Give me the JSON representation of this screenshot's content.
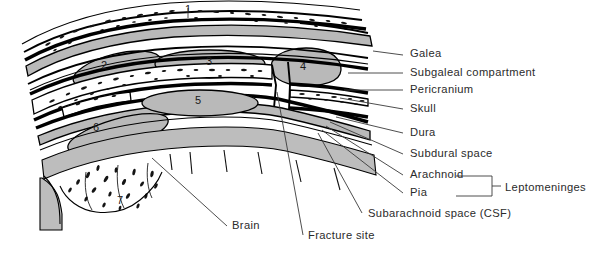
{
  "figure": {
    "region_numbers": [
      {
        "id": "1",
        "label": "1",
        "x": 188,
        "y": 13
      },
      {
        "id": "2",
        "label": "2",
        "x": 104,
        "y": 69
      },
      {
        "id": "3",
        "label": "3",
        "x": 209,
        "y": 65
      },
      {
        "id": "4",
        "label": "4",
        "x": 303,
        "y": 70
      },
      {
        "id": "5",
        "label": "5",
        "x": 198,
        "y": 104
      },
      {
        "id": "6",
        "label": "6",
        "x": 96,
        "y": 131
      },
      {
        "id": "7",
        "label": "7",
        "x": 120,
        "y": 204
      }
    ],
    "callouts": [
      {
        "id": "galea",
        "label": "Galea",
        "text_x": 410,
        "text_y": 57,
        "line": [
          [
            373,
            51
          ],
          [
            403,
            55
          ]
        ]
      },
      {
        "id": "subgaleal-compartment",
        "label": "Subgaleal compartment",
        "text_x": 410,
        "text_y": 76,
        "line": [
          [
            348,
            73
          ],
          [
            403,
            73
          ]
        ]
      },
      {
        "id": "pericranium",
        "label": "Pericranium",
        "text_x": 410,
        "text_y": 93,
        "line": [
          [
            344,
            90
          ],
          [
            403,
            90
          ]
        ]
      },
      {
        "id": "skull",
        "label": "Skull",
        "text_x": 410,
        "text_y": 112,
        "line": [
          [
            340,
            98
          ],
          [
            403,
            109
          ]
        ]
      },
      {
        "id": "dura",
        "label": "Dura",
        "text_x": 410,
        "text_y": 136,
        "line": [
          [
            336,
            117
          ],
          [
            403,
            133
          ]
        ]
      },
      {
        "id": "subdural-space",
        "label": "Subdural space",
        "text_x": 410,
        "text_y": 157,
        "line": [
          [
            330,
            122
          ],
          [
            403,
            154
          ]
        ]
      },
      {
        "id": "arachnoid",
        "label": "Arachnoid",
        "text_x": 410,
        "text_y": 178,
        "line": [
          [
            326,
            126
          ],
          [
            403,
            175
          ]
        ]
      },
      {
        "id": "pia",
        "label": "Pia",
        "text_x": 410,
        "text_y": 196,
        "line": [
          [
            322,
            130
          ],
          [
            403,
            193
          ]
        ]
      },
      {
        "id": "subarachnoid-space",
        "label": "Subarachnoid space (CSF)",
        "text_x": 368,
        "text_y": 217,
        "line": [
          [
            318,
            133
          ],
          [
            362,
            213
          ]
        ]
      },
      {
        "id": "brain",
        "label": "Brain",
        "text_x": 232,
        "text_y": 229,
        "line": [
          [
            152,
            158
          ],
          [
            227,
            226
          ]
        ]
      },
      {
        "id": "fracture-site",
        "label": "Fracture site",
        "text_x": 308,
        "text_y": 239,
        "line": [
          [
            277,
            92
          ],
          [
            303,
            235
          ]
        ]
      }
    ],
    "bracket": {
      "id": "leptomeninges",
      "label": "Leptomeninges",
      "text_x": 505,
      "text_y": 191,
      "top_y": 176,
      "bottom_y": 196,
      "left_x": 456,
      "spine_x": 492,
      "mid_y": 186,
      "tick_end_x": 501
    },
    "colors": {
      "gray_tissue": "#b9b9b9",
      "outline": "#000000",
      "text": "#2b2b2b",
      "background": "#ffffff",
      "leader": "#3a3a3a"
    }
  }
}
